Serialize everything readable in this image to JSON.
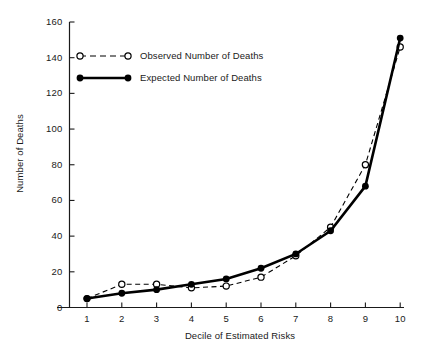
{
  "chart_data": {
    "type": "line",
    "title": "",
    "xlabel": "Decile of Estimated Risks",
    "ylabel": "Number of Deaths",
    "x": [
      1,
      2,
      3,
      4,
      5,
      6,
      7,
      8,
      9,
      10
    ],
    "xticklabels": [
      "1",
      "2",
      "3",
      "4",
      "5",
      "6",
      "7",
      "8",
      "9",
      "10"
    ],
    "yticks": [
      0,
      20,
      40,
      60,
      80,
      100,
      120,
      140,
      160
    ],
    "yticklabels": [
      "0",
      "20",
      "40",
      "60",
      "80",
      "100",
      "120",
      "140",
      "160"
    ],
    "xlim": [
      0.5,
      10.4
    ],
    "ylim": [
      0,
      160
    ],
    "grid": false,
    "legend_position": "upper-left-inside",
    "series": [
      {
        "name": "Observed Number of Deaths",
        "marker": "open-circle",
        "linestyle": "dashed",
        "color": "#000000",
        "values": [
          5,
          13,
          13,
          11,
          12,
          17,
          29,
          45,
          80,
          146
        ]
      },
      {
        "name": "Expected Number of Deaths",
        "marker": "filled-circle",
        "linestyle": "solid",
        "color": "#000000",
        "values": [
          5,
          8,
          10,
          13,
          16,
          22,
          30,
          43,
          68,
          151
        ]
      }
    ]
  },
  "legend": {
    "entries": [
      {
        "label": "Observed Number of Deaths"
      },
      {
        "label": "Expected Number of Deaths"
      }
    ]
  }
}
